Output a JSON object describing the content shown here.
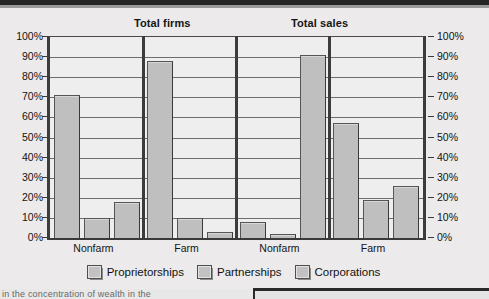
{
  "chart_data": {
    "type": "bar",
    "title": "",
    "panels": [
      {
        "title": "Total firms",
        "categories": [
          "Nonfarm",
          "Farm"
        ]
      },
      {
        "title": "Total sales",
        "categories": [
          "Nonfarm",
          "Farm"
        ]
      }
    ],
    "categories": [
      "Nonfarm",
      "Farm",
      "Nonfarm",
      "Farm"
    ],
    "group_panel": [
      "Total firms",
      "Total firms",
      "Total sales",
      "Total sales"
    ],
    "series": [
      {
        "name": "Proprietorships",
        "values": [
          71,
          88,
          8,
          57
        ]
      },
      {
        "name": "Partnerships",
        "values": [
          10,
          10,
          2,
          19
        ]
      },
      {
        "name": "Corporations",
        "values": [
          18,
          3,
          91,
          26
        ]
      }
    ],
    "xlabel": "",
    "ylabel": "",
    "ylim": [
      0,
      100
    ],
    "ytick_labels": [
      "100%",
      "90%",
      "80%",
      "70%",
      "60%",
      "50%",
      "40%",
      "30%",
      "20%",
      "10%",
      "0%"
    ],
    "ytick_values": [
      100,
      90,
      80,
      70,
      60,
      50,
      40,
      30,
      20,
      10,
      0
    ],
    "y_axes": [
      "left",
      "right"
    ],
    "grid": true,
    "legend_position": "bottom",
    "bar_fill": "#bfbfbf",
    "bar_stroke": "#555555"
  },
  "legend": {
    "items": [
      {
        "label": "Proprietorships"
      },
      {
        "label": "Partnerships"
      },
      {
        "label": "Corporations"
      }
    ]
  },
  "footer": {
    "fragment": "in the concentration of wealth in the"
  }
}
